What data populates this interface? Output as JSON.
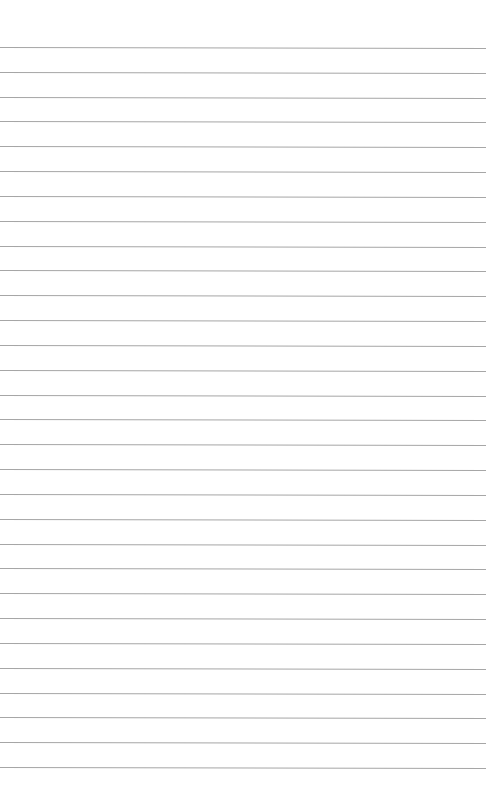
{
  "page": {
    "type": "ruled-paper",
    "background_color": "#ffffff",
    "line_color": "#a6a6a6",
    "line_count": 30,
    "first_line_y": 47,
    "line_spacing": 24.83,
    "line_width": 486,
    "text": ""
  }
}
